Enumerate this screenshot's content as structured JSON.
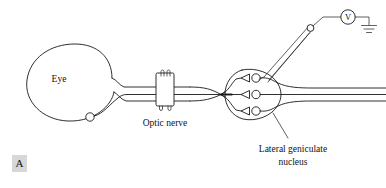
{
  "figure": {
    "panel_letter": "A",
    "title_implicit": "Recording from lateral geniculate nucleus neuron",
    "labels": {
      "eye": "Eye",
      "optic_nerve": "Optic nerve",
      "lgn_line1": "Lateral geniculate",
      "lgn_line2": "nucleus",
      "voltmeter": "V"
    },
    "icons": {
      "voltmeter": "voltmeter-icon",
      "ground": "ground-icon",
      "electrode": "microelectrode-icon",
      "nerve_cuff": "stimulating-cuff-icon",
      "ganglion_cell": "ganglion-cell-body-icon",
      "synaptic_terminal": "synaptic-terminal-icon",
      "lgn_cell": "lgn-cell-body-icon"
    },
    "colors": {
      "ink": "#1a1a1a",
      "ink_soft": "#2b2b2b",
      "background": "#ffffff",
      "panel_box": "#d7d7d7"
    },
    "counts": {
      "lgn_synapses": 3,
      "lgn_output_axons": 3,
      "retinal_ganglion_cells": 1,
      "cuff_prongs": 2
    }
  }
}
